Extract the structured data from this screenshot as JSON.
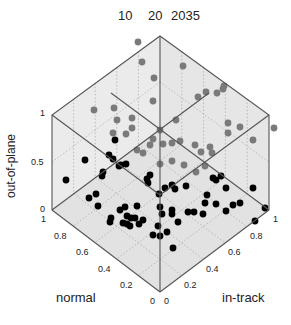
{
  "chart_data": {
    "type": "scatter",
    "projection": "3d-isometric-cube",
    "title": "",
    "top_labels": [
      "10",
      "20",
      "2035"
    ],
    "axes": {
      "x": {
        "label": "in-track",
        "ticks": [
          "0",
          "0.2",
          "0.4",
          "0.6",
          "0.8",
          "1"
        ],
        "range": [
          0,
          1
        ]
      },
      "y": {
        "label": "normal",
        "ticks": [
          "0",
          "0.2",
          "0.4",
          "0.6",
          "0.8",
          "1"
        ],
        "range": [
          0,
          1
        ]
      },
      "z": {
        "label": "out-of-plane",
        "ticks": [
          "0",
          "0.5",
          "1"
        ],
        "range": [
          0,
          1
        ]
      }
    },
    "grid": true,
    "legend": null,
    "series": [
      {
        "name": "points (dark, lower)",
        "color": "#000000",
        "count": 60
      },
      {
        "name": "points (gray, upper)",
        "color": "#808080",
        "count": 40
      }
    ]
  },
  "labels": {
    "top": {
      "a": "10",
      "b": "20",
      "c": "2035"
    },
    "zlabel": "out-of-plane",
    "ylabel": "normal",
    "xlabel": "in-track",
    "z_ticks": {
      "t0": "0",
      "t05": "0.5",
      "t1": "1"
    },
    "y_ticks": {
      "t1": "1",
      "t08": "0.8",
      "t06": "0.6",
      "t04": "0.4",
      "t02": "0.2",
      "t0": "0"
    },
    "x_ticks": {
      "t0": "0",
      "t02": "0.2",
      "t04": "0.4",
      "t06": "0.6",
      "t08": "0.8",
      "t1": "1"
    }
  },
  "points": {
    "dark": [
      [
        66,
        180
      ],
      [
        85,
        160
      ],
      [
        89,
        198
      ],
      [
        96,
        194
      ],
      [
        98,
        206
      ],
      [
        102,
        176
      ],
      [
        103,
        172
      ],
      [
        109,
        155
      ],
      [
        113,
        159
      ],
      [
        115,
        140
      ],
      [
        119,
        166
      ],
      [
        121,
        165
      ],
      [
        126,
        164
      ],
      [
        125,
        207
      ],
      [
        120,
        210
      ],
      [
        111,
        218
      ],
      [
        110,
        222
      ],
      [
        127,
        216
      ],
      [
        130,
        226
      ],
      [
        127,
        224
      ],
      [
        123,
        223
      ],
      [
        139,
        224
      ],
      [
        135,
        218
      ],
      [
        131,
        218
      ],
      [
        143,
        220
      ],
      [
        137,
        206
      ],
      [
        150,
        175
      ],
      [
        159,
        194
      ],
      [
        147,
        179
      ],
      [
        148,
        183
      ],
      [
        153,
        235
      ],
      [
        158,
        226
      ],
      [
        173,
        248
      ],
      [
        178,
        222
      ],
      [
        167,
        232
      ],
      [
        165,
        188
      ],
      [
        172,
        185
      ],
      [
        175,
        189
      ],
      [
        186,
        186
      ],
      [
        203,
        214
      ],
      [
        207,
        195
      ],
      [
        205,
        203
      ],
      [
        213,
        178
      ],
      [
        216,
        180
      ],
      [
        221,
        176
      ],
      [
        226,
        188
      ],
      [
        216,
        204
      ],
      [
        226,
        211
      ],
      [
        233,
        205
      ],
      [
        240,
        203
      ],
      [
        253,
        188
      ],
      [
        255,
        221
      ],
      [
        265,
        208
      ],
      [
        160,
        207
      ],
      [
        162,
        214
      ],
      [
        160,
        236
      ],
      [
        188,
        212
      ],
      [
        194,
        212
      ],
      [
        172,
        210
      ],
      [
        172,
        214
      ]
    ],
    "gray": [
      [
        138,
        42
      ],
      [
        142,
        62
      ],
      [
        154,
        78
      ],
      [
        183,
        66
      ],
      [
        153,
        101
      ],
      [
        198,
        97
      ],
      [
        206,
        92
      ],
      [
        217,
        93
      ],
      [
        223,
        89
      ],
      [
        224,
        86
      ],
      [
        228,
        123
      ],
      [
        253,
        140
      ],
      [
        274,
        128
      ],
      [
        94,
        110
      ],
      [
        114,
        108
      ],
      [
        132,
        118
      ],
      [
        132,
        128
      ],
      [
        126,
        134
      ],
      [
        113,
        133
      ],
      [
        117,
        120
      ],
      [
        137,
        150
      ],
      [
        143,
        153
      ],
      [
        150,
        145
      ],
      [
        153,
        139
      ],
      [
        163,
        144
      ],
      [
        180,
        141
      ],
      [
        172,
        143
      ],
      [
        195,
        145
      ],
      [
        210,
        147
      ],
      [
        212,
        153
      ],
      [
        201,
        152
      ],
      [
        184,
        165
      ],
      [
        172,
        161
      ],
      [
        196,
        172
      ],
      [
        205,
        166
      ],
      [
        228,
        133
      ],
      [
        240,
        127
      ],
      [
        160,
        130
      ],
      [
        176,
        120
      ],
      [
        160,
        164
      ]
    ]
  }
}
